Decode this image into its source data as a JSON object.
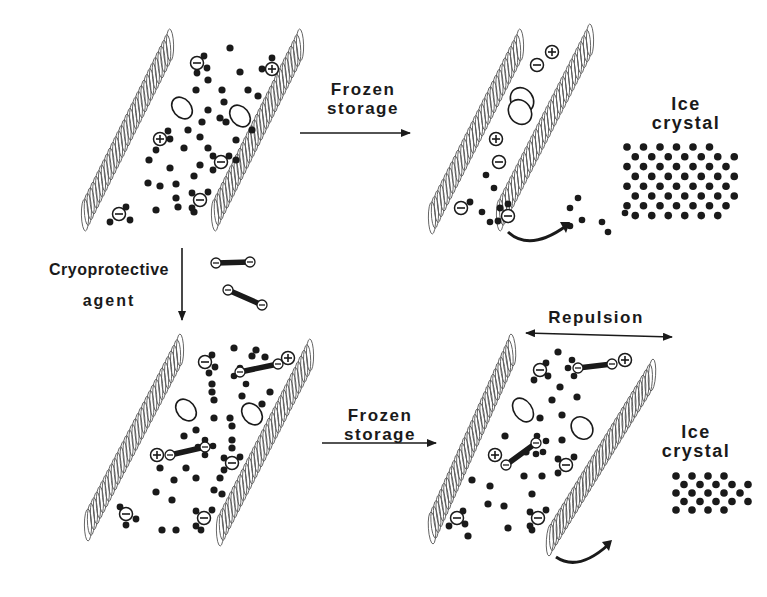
{
  "figure": {
    "colors": {
      "ink": "#1a1a1a",
      "helix": "#555555",
      "background": "#ffffff"
    },
    "panels": [
      {
        "id": "top-left",
        "description": "Native protein filaments with water molecules and charged groups"
      },
      {
        "id": "top-right",
        "description": "Aggregated filaments after frozen storage, water migrating to ice crystal"
      },
      {
        "id": "bottom-left",
        "description": "Filaments with cryoprotective agent bound between charged groups"
      },
      {
        "id": "bottom-right",
        "description": "Filaments kept apart by repulsion after frozen storage"
      }
    ],
    "labels": {
      "top_arrow": {
        "line1": "Frozen",
        "line2": "storage"
      },
      "top_ice": {
        "line1": "Ice",
        "line2": "crystal"
      },
      "cryo": {
        "line1": "Cryoprotective",
        "line2": "agent"
      },
      "bottom_arrow": {
        "line1": "Frozen",
        "line2": "storage"
      },
      "repulsion": "Repulsion",
      "bottom_ice": {
        "line1": "Ice",
        "line2": "crystal"
      }
    },
    "symbols": {
      "plus": "+",
      "minus": "−"
    }
  }
}
